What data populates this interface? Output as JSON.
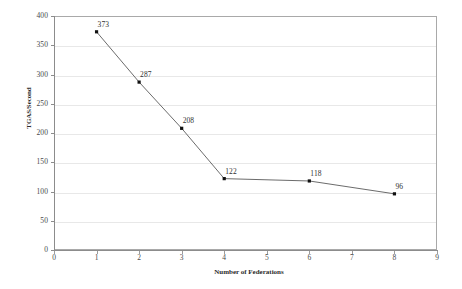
{
  "chart_data": {
    "type": "line",
    "title": "",
    "xlabel": "Number of Federations",
    "ylabel": "TGAS/Second",
    "xlim": [
      0,
      9
    ],
    "ylim": [
      0,
      400
    ],
    "xticks": [
      0,
      1,
      2,
      3,
      4,
      5,
      6,
      7,
      8,
      9
    ],
    "yticks": [
      0,
      50,
      100,
      150,
      200,
      250,
      300,
      350,
      400
    ],
    "grid": "horizontal",
    "legend": "none",
    "marker": "square",
    "series": [
      {
        "name": "TGAS/Second",
        "x": [
          1,
          2,
          3,
          4,
          6,
          8
        ],
        "values": [
          373,
          287,
          208,
          122,
          118,
          96
        ],
        "labels": [
          "373",
          "287",
          "208",
          "122",
          "118",
          "96"
        ]
      }
    ]
  },
  "axes": {
    "x_tick_labels": [
      "0",
      "1",
      "2",
      "3",
      "4",
      "5",
      "6",
      "7",
      "8",
      "9"
    ],
    "y_tick_labels": [
      "0",
      "50",
      "100",
      "150",
      "200",
      "250",
      "300",
      "350",
      "400"
    ],
    "x_title": "Number of Federations",
    "y_title": "TGAS/Second"
  },
  "colors": {
    "line": "#5a5a5a",
    "marker": "#111111",
    "grid": "#e8e8e8",
    "frame": "#a9a9a9",
    "text": "#2f2f2f",
    "background": "#ffffff"
  }
}
